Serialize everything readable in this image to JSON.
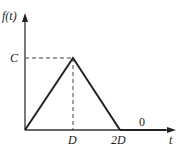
{
  "diagram": {
    "type": "triangular-pulse",
    "y_axis_label": "f(t)",
    "x_axis_label": "t",
    "peak_label": "C",
    "x_ticks": [
      "D",
      "2D"
    ],
    "region_label": "0",
    "colors": {
      "line": "#222222",
      "axis": "#333333",
      "dash": "#444444"
    },
    "points": [
      {
        "t": "0",
        "f": "0"
      },
      {
        "t": "D",
        "f": "C"
      },
      {
        "t": "2D",
        "f": "0"
      }
    ]
  }
}
